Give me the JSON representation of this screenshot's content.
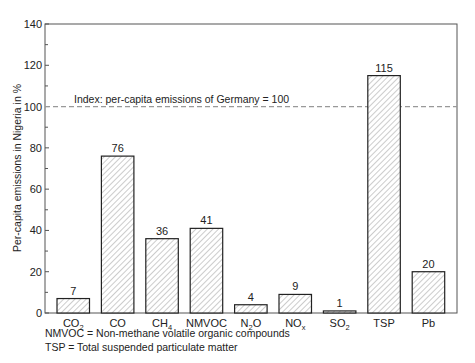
{
  "chart_data": {
    "type": "bar",
    "title": "",
    "xlabel": "",
    "ylabel": "Per-capita emissions in Nigeria in %",
    "ylim": [
      0,
      140
    ],
    "yticks": [
      0,
      20,
      40,
      60,
      80,
      100,
      120,
      140
    ],
    "grid": false,
    "categories": [
      "CO2",
      "CO",
      "CH4",
      "NMVOC",
      "N2O",
      "NOx",
      "SO2",
      "TSP",
      "Pb"
    ],
    "category_labels": [
      {
        "base": "CO",
        "sub": "2"
      },
      {
        "base": "CO",
        "sub": ""
      },
      {
        "base": "CH",
        "sub": "4"
      },
      {
        "base": "NMVOC",
        "sub": ""
      },
      {
        "base": "N",
        "sub": "2",
        "tail": "O"
      },
      {
        "base": "NO",
        "sub": "x"
      },
      {
        "base": "SO",
        "sub": "2"
      },
      {
        "base": "TSP",
        "sub": ""
      },
      {
        "base": "Pb",
        "sub": ""
      }
    ],
    "values": [
      7,
      76,
      36,
      41,
      4,
      9,
      1,
      115,
      20
    ],
    "reference_line": {
      "value": 100,
      "label": "Index: per-capita emissions of Germany = 100",
      "style": "dashed"
    },
    "bar_fill": "diagonal-hatch",
    "notes": [
      "NMVOC = Non-methane volatile organic compounds",
      "TSP = Total suspended particulate matter"
    ]
  },
  "colors": {
    "axis": "#555555",
    "bar_edge": "#222222",
    "hatch": "#9a9a9a",
    "ref_line": "#999999"
  }
}
